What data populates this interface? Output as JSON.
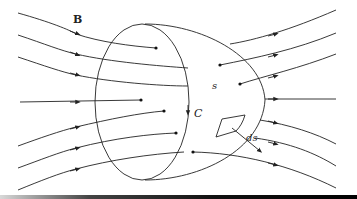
{
  "figure": {
    "labels": {
      "field": "B",
      "surface": "s",
      "curve": "C",
      "element": "ds"
    },
    "colors": {
      "stroke": "#222222",
      "background": "#ffffff"
    },
    "field_lines_count": 7
  }
}
